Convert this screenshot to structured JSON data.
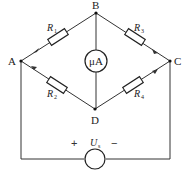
{
  "diagram": {
    "nodes": {
      "A": "A",
      "B": "B",
      "C": "C",
      "D": "D"
    },
    "resistors": [
      {
        "id": "R1",
        "label": "R",
        "sub": "1",
        "between": "A-B"
      },
      {
        "id": "R3",
        "label": "R",
        "sub": "3",
        "between": "B-C"
      },
      {
        "id": "R2",
        "label": "R",
        "sub": "2",
        "between": "A-D"
      },
      {
        "id": "R4",
        "label": "R",
        "sub": "4",
        "between": "D-C"
      }
    ],
    "meter": {
      "label": "μA",
      "between": "B-D"
    },
    "source": {
      "label": "U",
      "sub": "s",
      "plus": "+",
      "minus": "−",
      "between": "A-C"
    }
  }
}
